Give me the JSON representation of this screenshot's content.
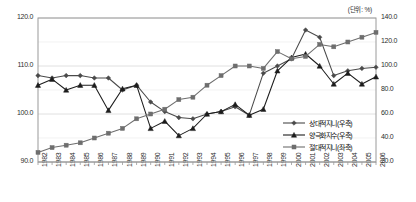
{
  "unit_note": "(단위: %)",
  "chart_data": {
    "type": "line",
    "title": "",
    "xlabel": "",
    "ylabel": "",
    "grid": true,
    "legend_position": "inside-bottom-right",
    "categories": [
      "1982",
      "1983",
      "1984",
      "1985",
      "1986",
      "1987",
      "1988",
      "1989",
      "1990",
      "1991",
      "1992",
      "1993",
      "1994",
      "1995",
      "1996",
      "1997",
      "1998",
      "1999",
      "2000",
      "2001",
      "2002",
      "2003",
      "2004",
      "2005",
      "2006"
    ],
    "axes": {
      "left": {
        "label": "좌축",
        "ylim": [
          90.0,
          120.0
        ],
        "ticks": [
          90.0,
          100.0,
          110.0,
          120.0
        ],
        "tick_labels": [
          "90.0",
          "100.0",
          "110.0",
          "120.0"
        ]
      },
      "right": {
        "label": "우축",
        "ylim": [
          20.0,
          140.0
        ],
        "ticks": [
          20.0,
          40.0,
          60.0,
          80.0,
          100.0,
          120.0,
          140.0
        ],
        "tick_labels": [
          "20.0",
          "40.0",
          "60.0",
          "80.0",
          "100.0",
          "120.0",
          "140.0"
        ]
      }
    },
    "series": [
      {
        "name": "상대적지니(우축)",
        "axis": "right",
        "marker": "diamond",
        "color": "#4a4a4a",
        "values": [
          92.0,
          90.0,
          92.0,
          92.0,
          90.0,
          90.0,
          80.0,
          84.0,
          70.0,
          62.0,
          57.0,
          56.0,
          60.0,
          62.0,
          66.0,
          59.0,
          94.0,
          100.0,
          106.0,
          130.0,
          124.0,
          92.0,
          96.0,
          98.0,
          99.0
        ]
      },
      {
        "name": "양극화지수(우축)",
        "axis": "right",
        "marker": "triangle",
        "color": "#1c1c1c",
        "values": [
          84.0,
          89.0,
          80.0,
          84.0,
          84.0,
          63.0,
          81.0,
          84.0,
          48.0,
          54.0,
          42.0,
          48.0,
          60.0,
          62.0,
          68.0,
          59.0,
          64.0,
          96.0,
          107.0,
          110.0,
          100.0,
          85.0,
          94.0,
          85.0,
          91.0
        ]
      },
      {
        "name": "절대적지니(좌축)",
        "axis": "left",
        "marker": "square",
        "color": "#6e6e6e",
        "values": [
          92.0,
          93.0,
          93.5,
          94.0,
          95.0,
          96.0,
          97.0,
          99.0,
          100.0,
          101.0,
          103.0,
          103.5,
          106.0,
          108.0,
          110.0,
          110.0,
          109.5,
          113.0,
          111.5,
          112.0,
          114.5,
          114.0,
          115.0,
          116.0,
          117.0
        ]
      }
    ]
  },
  "legend": {
    "items": [
      {
        "label": "상대적지니(우축)"
      },
      {
        "label": "양극화지수(우축)"
      },
      {
        "label": "절대적지니(좌축)"
      }
    ]
  }
}
